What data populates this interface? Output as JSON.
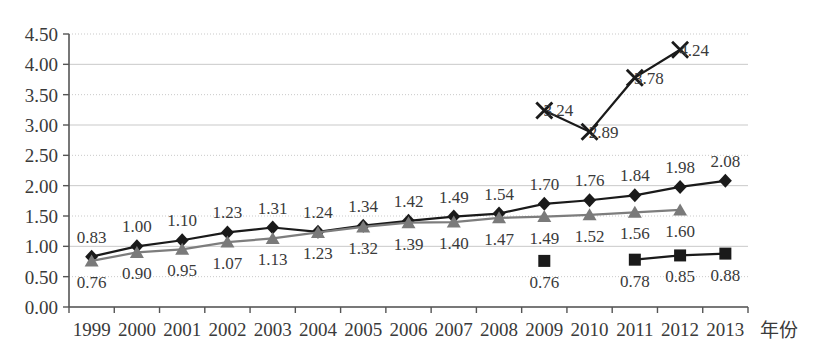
{
  "chart_data": {
    "type": "line",
    "title": "",
    "subtitle": "",
    "xlabel": "年份",
    "ylabel": "",
    "grid": true,
    "legend": "none",
    "categories": [
      "1999",
      "2000",
      "2001",
      "2002",
      "2003",
      "2004",
      "2005",
      "2006",
      "2007",
      "2008",
      "2009",
      "2010",
      "2011",
      "2012",
      "2013"
    ],
    "x": [
      1999,
      2000,
      2001,
      2002,
      2003,
      2004,
      2005,
      2006,
      2007,
      2008,
      2009,
      2010,
      2011,
      2012,
      2013
    ],
    "ylim": [
      0.0,
      4.5
    ],
    "ytick_labels": [
      "0.00",
      "0.50",
      "1.00",
      "1.50",
      "2.00",
      "2.50",
      "3.00",
      "3.50",
      "4.00",
      "4.50"
    ],
    "ytick_values": [
      0.0,
      0.5,
      1.0,
      1.5,
      2.0,
      2.5,
      3.0,
      3.5,
      4.0,
      4.5
    ],
    "ytick_step": 0.5,
    "series": [
      {
        "name": "series-diamond",
        "marker": "diamond",
        "color": "#1a1a1a",
        "label_position": "above",
        "points": [
          {
            "x": 1999,
            "y": 0.83,
            "label": "0.83"
          },
          {
            "x": 2000,
            "y": 1.0,
            "label": "1.00"
          },
          {
            "x": 2001,
            "y": 1.1,
            "label": "1.10"
          },
          {
            "x": 2002,
            "y": 1.23,
            "label": "1.23"
          },
          {
            "x": 2003,
            "y": 1.31,
            "label": "1.31"
          },
          {
            "x": 2004,
            "y": 1.24,
            "label": "1.24"
          },
          {
            "x": 2005,
            "y": 1.34,
            "label": "1.34"
          },
          {
            "x": 2006,
            "y": 1.42,
            "label": "1.42"
          },
          {
            "x": 2007,
            "y": 1.49,
            "label": "1.49"
          },
          {
            "x": 2008,
            "y": 1.54,
            "label": "1.54"
          },
          {
            "x": 2009,
            "y": 1.7,
            "label": "1.70"
          },
          {
            "x": 2010,
            "y": 1.76,
            "label": "1.76"
          },
          {
            "x": 2011,
            "y": 1.84,
            "label": "1.84"
          },
          {
            "x": 2012,
            "y": 1.98,
            "label": "1.98"
          },
          {
            "x": 2013,
            "y": 2.08,
            "label": "2.08"
          }
        ]
      },
      {
        "name": "series-triangle",
        "marker": "triangle",
        "color": "#7a7a7a",
        "label_position": "below",
        "points": [
          {
            "x": 1999,
            "y": 0.76,
            "label": "0.76"
          },
          {
            "x": 2000,
            "y": 0.9,
            "label": "0.90"
          },
          {
            "x": 2001,
            "y": 0.95,
            "label": "0.95"
          },
          {
            "x": 2002,
            "y": 1.07,
            "label": "1.07"
          },
          {
            "x": 2003,
            "y": 1.13,
            "label": "1.13"
          },
          {
            "x": 2004,
            "y": 1.23,
            "label": "1.23"
          },
          {
            "x": 2005,
            "y": 1.32,
            "label": "1.32"
          },
          {
            "x": 2006,
            "y": 1.39,
            "label": "1.39"
          },
          {
            "x": 2007,
            "y": 1.4,
            "label": "1.40"
          },
          {
            "x": 2008,
            "y": 1.47,
            "label": "1.47"
          },
          {
            "x": 2009,
            "y": 1.49,
            "label": "1.49"
          },
          {
            "x": 2010,
            "y": 1.52,
            "label": "1.52"
          },
          {
            "x": 2011,
            "y": 1.56,
            "label": "1.56"
          },
          {
            "x": 2012,
            "y": 1.6,
            "label": "1.60"
          }
        ]
      },
      {
        "name": "series-cross",
        "marker": "x",
        "color": "#1a1a1a",
        "label_position": "right",
        "points": [
          {
            "x": 2009,
            "y": 3.24,
            "label": "3.24"
          },
          {
            "x": 2010,
            "y": 2.89,
            "label": "2.89"
          },
          {
            "x": 2011,
            "y": 3.78,
            "label": "3.78"
          },
          {
            "x": 2012,
            "y": 4.24,
            "label": "4.24"
          }
        ]
      },
      {
        "name": "series-square",
        "marker": "square",
        "color": "#1a1a1a",
        "label_position": "below",
        "segments": [
          [
            2009
          ],
          [
            2011,
            2012,
            2013
          ]
        ],
        "points": [
          {
            "x": 2009,
            "y": 0.76,
            "label": "0.76"
          },
          {
            "x": 2011,
            "y": 0.78,
            "label": "0.78"
          },
          {
            "x": 2012,
            "y": 0.85,
            "label": "0.85"
          },
          {
            "x": 2013,
            "y": 0.88,
            "label": "0.88"
          }
        ]
      }
    ]
  },
  "axis": {
    "x_title": "年份"
  }
}
